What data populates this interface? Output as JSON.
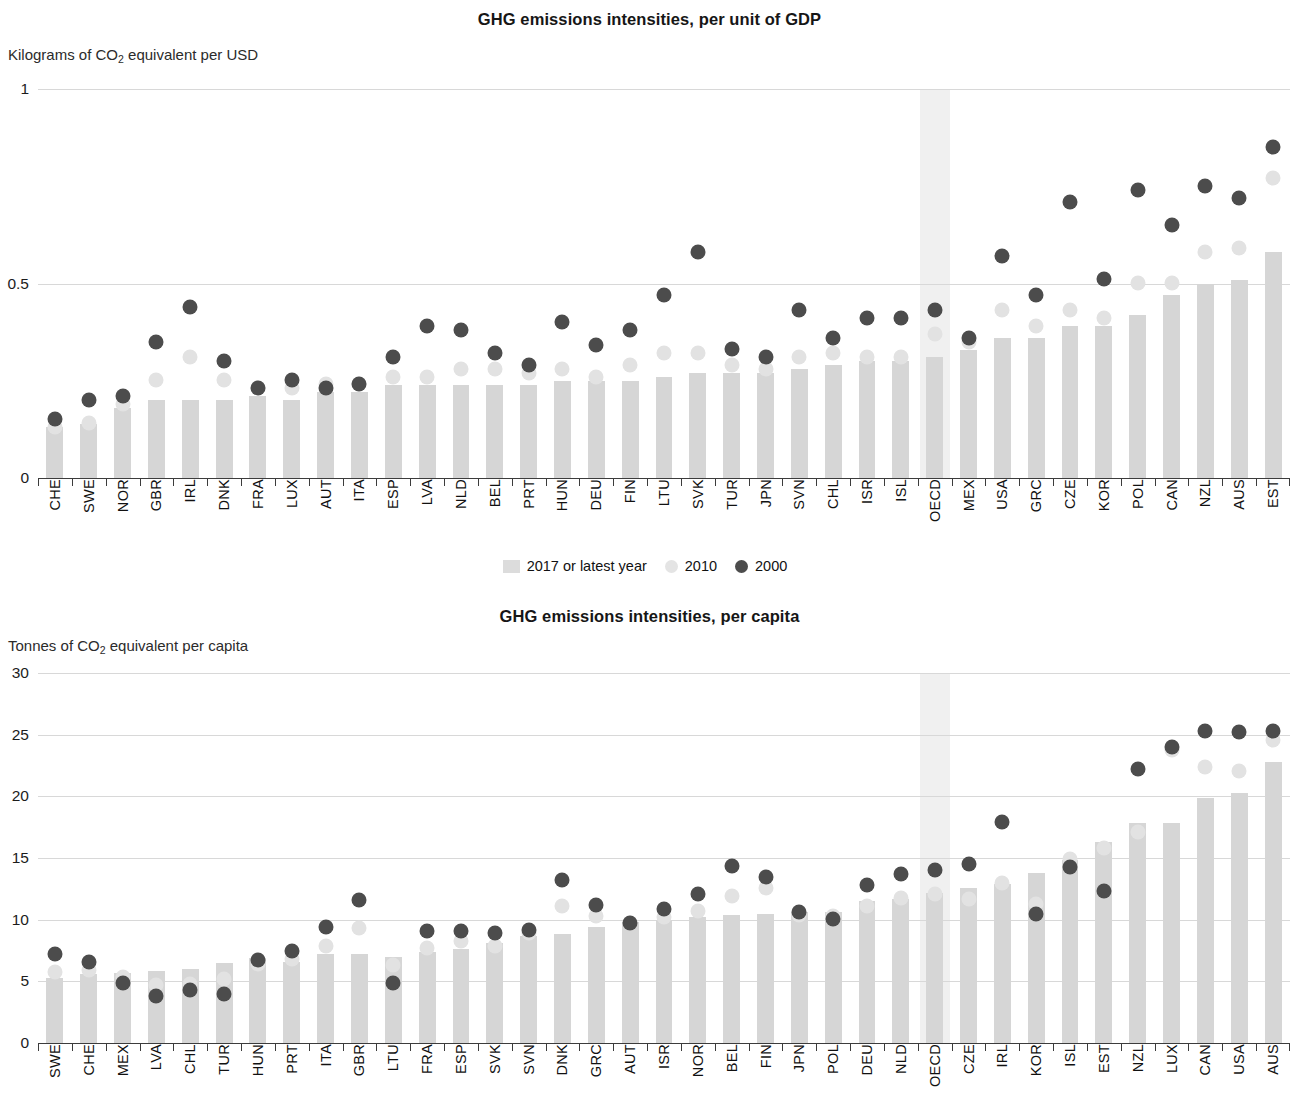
{
  "colors": {
    "bar": "#d6d6d6",
    "dot_2000": "#4c4c4c",
    "dot_2010": "#e2e2e2",
    "gridline": "#d8d8d8",
    "axis": "#3c3c3c",
    "highlight_band": "#ededed"
  },
  "legend": {
    "bar_label": "2017 or latest year",
    "dot2010_label": "2010",
    "dot2000_label": "2000"
  },
  "panel_gdp": {
    "title": "GHG emissions intensities, per unit of GDP",
    "axis_unit_prefix": "Kilograms of CO",
    "axis_unit_sub": "2",
    "axis_unit_suffix": " equivalent per USD"
  },
  "panel_capita": {
    "title": "GHG emissions intensities, per capita",
    "axis_unit_prefix": "Tonnes of CO",
    "axis_unit_sub": "2",
    "axis_unit_suffix": " equivalent per capita"
  },
  "chart_data": [
    {
      "id": "gdp",
      "type": "bar",
      "title": "GHG emissions intensities, per unit of GDP",
      "xlabel": "",
      "ylabel": "Kilograms of CO2 equivalent per USD",
      "ylim": [
        0,
        1
      ],
      "yticks": [
        0,
        0.5,
        1
      ],
      "ytick_labels": [
        "0",
        "0.5",
        "1"
      ],
      "grid": true,
      "legend_position": "bottom-center",
      "highlight_category": "OECD",
      "categories": [
        "CHE",
        "SWE",
        "NOR",
        "GBR",
        "IRL",
        "DNK",
        "FRA",
        "LUX",
        "AUT",
        "ITA",
        "ESP",
        "LVA",
        "NLD",
        "BEL",
        "PRT",
        "HUN",
        "DEU",
        "FIN",
        "LTU",
        "SVK",
        "TUR",
        "JPN",
        "SVN",
        "CHL",
        "ISR",
        "ISL",
        "OECD",
        "MEX",
        "USA",
        "GRC",
        "CZE",
        "KOR",
        "POL",
        "CAN",
        "NZL",
        "AUS",
        "EST"
      ],
      "series": [
        {
          "name": "2017 or latest year",
          "kind": "bar",
          "values": [
            0.13,
            0.14,
            0.18,
            0.2,
            0.2,
            0.2,
            0.21,
            0.2,
            0.22,
            0.22,
            0.24,
            0.24,
            0.24,
            0.24,
            0.24,
            0.25,
            0.25,
            0.25,
            0.26,
            0.27,
            0.27,
            0.27,
            0.28,
            0.29,
            0.3,
            0.3,
            0.31,
            0.33,
            0.36,
            0.36,
            0.39,
            0.39,
            0.42,
            0.47,
            0.5,
            0.51,
            0.58
          ]
        },
        {
          "name": "2010",
          "kind": "dot",
          "values": [
            0.15,
            0.16,
            0.21,
            0.27,
            0.33,
            0.27,
            0.25,
            0.25,
            0.26,
            0.26,
            0.28,
            0.28,
            0.3,
            0.3,
            0.29,
            0.3,
            0.28,
            0.31,
            0.34,
            0.34,
            0.31,
            0.3,
            0.33,
            0.34,
            0.33,
            0.33,
            0.39,
            0.37,
            0.45,
            0.41,
            0.45,
            0.43,
            0.52,
            0.52,
            0.6,
            0.61,
            0.79
          ]
        },
        {
          "name": "2000",
          "kind": "dot",
          "values": [
            0.17,
            0.22,
            0.23,
            0.37,
            0.46,
            0.32,
            0.25,
            0.27,
            0.25,
            0.26,
            0.33,
            0.41,
            0.4,
            0.34,
            0.31,
            0.42,
            0.36,
            0.4,
            0.49,
            0.6,
            0.35,
            0.33,
            0.45,
            0.38,
            0.43,
            0.43,
            0.45,
            0.38,
            0.59,
            0.49,
            0.73,
            0.53,
            0.76,
            0.67,
            0.77,
            0.74,
            0.87
          ]
        }
      ]
    },
    {
      "id": "capita",
      "type": "bar",
      "title": "GHG emissions intensities, per capita",
      "xlabel": "",
      "ylabel": "Tonnes of CO2 equivalent per capita",
      "ylim": [
        0,
        30
      ],
      "yticks": [
        0,
        5,
        10,
        15,
        20,
        25,
        30
      ],
      "ytick_labels": [
        "0",
        "5",
        "10",
        "15",
        "20",
        "25",
        "30"
      ],
      "grid": true,
      "legend_position": "none",
      "highlight_category": "OECD",
      "categories": [
        "SWE",
        "CHE",
        "MEX",
        "LVA",
        "CHL",
        "TUR",
        "HUN",
        "PRT",
        "ITA",
        "GBR",
        "LTU",
        "FRA",
        "ESP",
        "SVK",
        "SVN",
        "DNK",
        "GRC",
        "AUT",
        "ISR",
        "NOR",
        "BEL",
        "FIN",
        "JPN",
        "POL",
        "DEU",
        "NLD",
        "OECD",
        "CZE",
        "IRL",
        "KOR",
        "ISL",
        "EST",
        "NZL",
        "LUX",
        "CAN",
        "USA",
        "AUS"
      ],
      "series": [
        {
          "name": "2017 or latest year",
          "kind": "bar",
          "values": [
            5.3,
            5.6,
            5.7,
            5.8,
            6.0,
            6.5,
            6.9,
            6.6,
            7.2,
            7.2,
            7.0,
            7.4,
            7.6,
            8.1,
            8.7,
            8.8,
            9.4,
            9.8,
            10.0,
            10.2,
            10.4,
            10.5,
            10.6,
            10.6,
            11.5,
            11.7,
            12.2,
            12.6,
            12.9,
            13.8,
            14.8,
            16.3,
            17.8,
            17.8,
            19.9,
            20.3,
            22.8
          ]
        },
        {
          "name": "2010",
          "kind": "dot",
          "values": [
            6.4,
            6.5,
            6.0,
            5.3,
            5.4,
            5.8,
            7.0,
            7.4,
            8.5,
            9.9,
            6.9,
            8.3,
            8.9,
            8.5,
            9.5,
            11.7,
            10.9,
            10.3,
            10.8,
            11.3,
            12.5,
            13.2,
            11.0,
            10.9,
            11.7,
            12.4,
            12.7,
            12.3,
            13.6,
            11.9,
            15.5,
            16.4,
            17.7,
            24.4,
            23.0,
            22.7,
            25.2
          ]
        },
        {
          "name": "2000",
          "kind": "dot",
          "values": [
            7.8,
            7.2,
            5.5,
            4.4,
            4.9,
            4.6,
            7.3,
            8.1,
            10.0,
            12.2,
            5.5,
            9.7,
            9.7,
            9.5,
            9.8,
            13.8,
            11.8,
            10.3,
            11.5,
            12.7,
            15.0,
            14.1,
            11.2,
            10.7,
            13.4,
            14.3,
            14.6,
            15.1,
            18.5,
            11.1,
            14.9,
            12.9,
            22.8,
            24.6,
            25.9,
            25.8,
            25.9
          ]
        }
      ]
    }
  ]
}
